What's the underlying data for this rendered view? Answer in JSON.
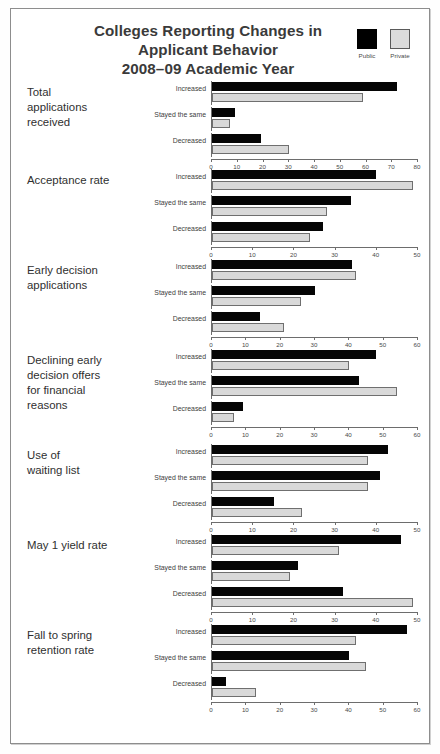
{
  "header": {
    "title": "Colleges Reporting Changes in\nApplicant Behavior\n2008–09 Academic Year",
    "legend": [
      {
        "label": "Public",
        "color": "#000000"
      },
      {
        "label": "Private",
        "color": "#d9d9d9"
      }
    ]
  },
  "colors": {
    "public": "#000000",
    "private": "#d9d9d9",
    "axis": "#6d6d6d",
    "text": "#3a3a3a",
    "frame": "#8d8d8d"
  },
  "chart_data": {
    "type": "bar",
    "title": "Colleges Reporting Changes in Applicant Behavior 2008–09 Academic Year",
    "subtitle": "",
    "xlabel": "",
    "ylabel": "",
    "orientation": "horizontal",
    "grid": false,
    "legend_position": "top-right",
    "series_names": [
      "Public",
      "Private"
    ],
    "categories": [
      "Increased",
      "Stayed the same",
      "Decreased"
    ],
    "panels": [
      {
        "title": "Total\napplications\nreceived",
        "xlim": [
          0,
          80
        ],
        "xticks": [
          0,
          10,
          20,
          30,
          40,
          50,
          60,
          70,
          80
        ],
        "series": [
          {
            "name": "Public",
            "values": [
              72,
              9,
              19
            ]
          },
          {
            "name": "Private",
            "values": [
              59,
              7,
              30
            ]
          }
        ]
      },
      {
        "title": "Acceptance rate",
        "xlim": [
          0,
          50
        ],
        "xticks": [
          0,
          10,
          20,
          30,
          40,
          50
        ],
        "series": [
          {
            "name": "Public",
            "values": [
              40,
              34,
              27
            ]
          },
          {
            "name": "Private",
            "values": [
              49,
              28,
              24
            ]
          }
        ]
      },
      {
        "title": "Early decision\napplications",
        "xlim": [
          0,
          60
        ],
        "xticks": [
          0,
          10,
          20,
          30,
          40,
          50,
          60
        ],
        "series": [
          {
            "name": "Public",
            "values": [
              41,
              30,
              14
            ]
          },
          {
            "name": "Private",
            "values": [
              42,
              26,
              21
            ]
          }
        ]
      },
      {
        "title": "Declining early\ndecision offers\nfor financial\nreasons",
        "xlim": [
          0,
          60
        ],
        "xticks": [
          0,
          10,
          20,
          30,
          40,
          50,
          60
        ],
        "series": [
          {
            "name": "Public",
            "values": [
              48,
              43,
              9
            ]
          },
          {
            "name": "Private",
            "values": [
              40,
              54,
              6.5
            ]
          }
        ]
      },
      {
        "title": "Use of\nwaiting list",
        "xlim": [
          0,
          50
        ],
        "xticks": [
          0,
          10,
          20,
          30,
          40,
          50
        ],
        "series": [
          {
            "name": "Public",
            "values": [
              43,
              41,
              15
            ]
          },
          {
            "name": "Private",
            "values": [
              38,
              38,
              22
            ]
          }
        ]
      },
      {
        "title": "May 1 yield rate",
        "xlim": [
          0,
          50
        ],
        "xticks": [
          0,
          10,
          20,
          30,
          40,
          50
        ],
        "series": [
          {
            "name": "Public",
            "values": [
              46,
              21,
              32
            ]
          },
          {
            "name": "Private",
            "values": [
              31,
              19,
              49
            ]
          }
        ]
      },
      {
        "title": "Fall to spring\nretention rate",
        "xlim": [
          0,
          60
        ],
        "xticks": [
          0,
          10,
          20,
          30,
          40,
          50,
          60
        ],
        "series": [
          {
            "name": "Public",
            "values": [
              57,
              40,
              4
            ]
          },
          {
            "name": "Private",
            "values": [
              42,
              45,
              13
            ]
          }
        ]
      }
    ]
  }
}
